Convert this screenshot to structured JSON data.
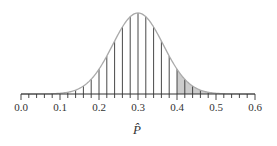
{
  "chart_data": {
    "type": "area",
    "title": "",
    "xlabel": "P̂",
    "ylabel": "",
    "distribution": {
      "kind": "normal",
      "mean": 0.3,
      "sd": 0.065
    },
    "xlim": [
      0.0,
      0.6
    ],
    "tick_labels": [
      "0.0",
      "0.1",
      "0.2",
      "0.3",
      "0.4",
      "0.5",
      "0.6"
    ],
    "major_ticks": [
      0.0,
      0.1,
      0.2,
      0.3,
      0.4,
      0.5,
      0.6
    ],
    "minor_tick_step": 0.02,
    "vertical_lines": {
      "from": 0.12,
      "to": 0.48,
      "step": 0.02
    },
    "shaded_region": {
      "from": 0.4,
      "to": 0.5,
      "color": "#cccccc"
    },
    "grid": false,
    "legend": null
  },
  "colors": {
    "curve": "#aaaaaa",
    "lines": "#333333",
    "axis": "#333333",
    "shade": "#cccccc"
  }
}
